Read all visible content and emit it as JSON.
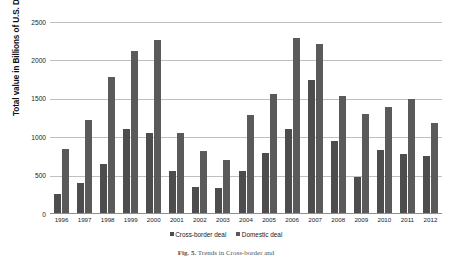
{
  "chart_data": {
    "type": "bar",
    "title": "",
    "xlabel": "",
    "ylabel": "Total value in Billions of U.S. Dollars",
    "ylim": [
      0,
      2500
    ],
    "yticks": [
      2500,
      2000,
      1500,
      1000,
      500,
      0
    ],
    "grid": true,
    "legend_position": "bottom",
    "categories": [
      "1996",
      "1997",
      "1998",
      "1999",
      "2000",
      "2001",
      "2002",
      "2003",
      "2004",
      "2005",
      "2006",
      "2007",
      "2008",
      "2009",
      "2010",
      "2011",
      "2012"
    ],
    "series": [
      {
        "name": "Cross-border deal",
        "color": "#4d4d4d",
        "values": [
          260,
          400,
          650,
          1110,
          1060,
          560,
          355,
          340,
          560,
          790,
          1110,
          1740,
          950,
          480,
          830,
          780,
          750
        ]
      },
      {
        "name": "Domestic deal",
        "color": "#5a5a5a",
        "values": [
          850,
          1230,
          1790,
          2120,
          2260,
          1050,
          820,
          700,
          1290,
          1560,
          2290,
          2220,
          1540,
          1300,
          1390,
          1500,
          1190
        ]
      }
    ]
  },
  "axis": {
    "y_title": "Total value in Billions of U.S. Dollars",
    "tick_labels": [
      "2500",
      "2000",
      "1500",
      "1000",
      "500",
      "0"
    ]
  },
  "legend": {
    "items": [
      {
        "label": "Cross-border deal",
        "color": "#4d4d4d"
      },
      {
        "label": "Domestic deal",
        "color": "#5a5a5a"
      }
    ]
  },
  "caption": {
    "figure_number": "Fig. 5.",
    "text": "Trends in Cross-border and"
  }
}
